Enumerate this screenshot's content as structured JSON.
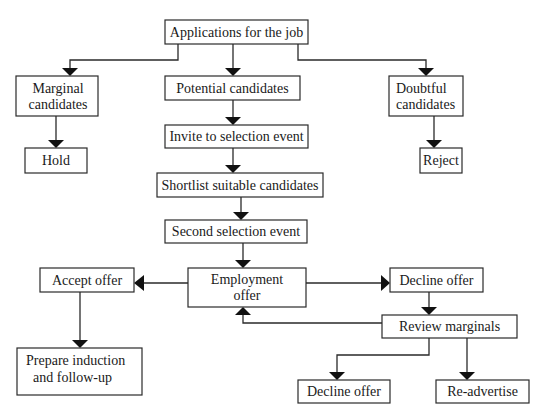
{
  "diagram": {
    "type": "flowchart",
    "title": "Applications for the job",
    "nodes": {
      "applications": {
        "lines": [
          "Applications for the job"
        ]
      },
      "marginal": {
        "lines": [
          "Marginal",
          "candidates"
        ]
      },
      "potential": {
        "lines": [
          "Potential candidates"
        ]
      },
      "doubtful": {
        "lines": [
          "Doubtful",
          "candidates"
        ]
      },
      "hold": {
        "lines": [
          "Hold"
        ]
      },
      "reject": {
        "lines": [
          "Reject"
        ]
      },
      "invite": {
        "lines": [
          "Invite to selection event"
        ]
      },
      "shortlist": {
        "lines": [
          "Shortlist suitable candidates"
        ]
      },
      "second": {
        "lines": [
          "Second selection event"
        ]
      },
      "employment": {
        "lines": [
          "Employment",
          "offer"
        ]
      },
      "accept": {
        "lines": [
          "Accept offer"
        ]
      },
      "decline_top": {
        "lines": [
          "Decline offer"
        ]
      },
      "review": {
        "lines": [
          "Review marginals"
        ]
      },
      "prepare": {
        "lines": [
          "Prepare induction",
          "and follow-up"
        ]
      },
      "decline_bottom": {
        "lines": [
          "Decline offer"
        ]
      },
      "readvertise": {
        "lines": [
          "Re-advertise"
        ]
      }
    },
    "edges": [
      [
        "applications",
        "marginal"
      ],
      [
        "applications",
        "potential"
      ],
      [
        "applications",
        "doubtful"
      ],
      [
        "marginal",
        "hold"
      ],
      [
        "doubtful",
        "reject"
      ],
      [
        "potential",
        "invite"
      ],
      [
        "invite",
        "shortlist"
      ],
      [
        "shortlist",
        "second"
      ],
      [
        "second",
        "employment"
      ],
      [
        "employment",
        "accept"
      ],
      [
        "employment",
        "decline_top"
      ],
      [
        "accept",
        "prepare"
      ],
      [
        "decline_top",
        "review"
      ],
      [
        "review",
        "employment"
      ],
      [
        "review",
        "decline_bottom"
      ],
      [
        "review",
        "readvertise"
      ]
    ]
  }
}
